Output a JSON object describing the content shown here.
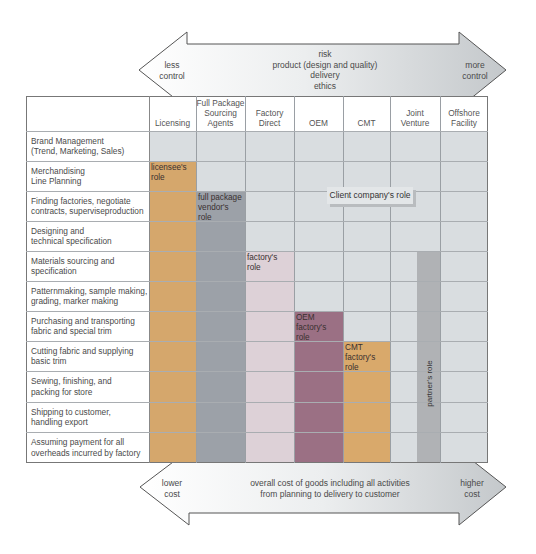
{
  "top_arrow": {
    "left_label": "less\ncontrol",
    "center_label": "risk\nproduct (design and quality)\ndelivery\nethics",
    "right_label": "more\ncontrol"
  },
  "bottom_arrow": {
    "left_label": "lower\ncost",
    "center_label": "overall cost of goods including all activities\nfrom planning to delivery to customer",
    "right_label": "higher\ncost"
  },
  "columns": [
    {
      "label": "Licensing"
    },
    {
      "label": "Full Package\nSourcing\nAgents"
    },
    {
      "label": "Factory\nDirect"
    },
    {
      "label": "OEM"
    },
    {
      "label": "CMT"
    },
    {
      "label": "Joint\nVenture"
    },
    {
      "label": "Offshore\nFacility"
    }
  ],
  "rows": [
    {
      "label": "Brand Management\n(Trend, Marketing, Sales)"
    },
    {
      "label": "Merchandising\nLine Planning"
    },
    {
      "label": "Finding factories, negotiate\ncontracts, superviseproduction"
    },
    {
      "label": "Designing and\ntechnical specification"
    },
    {
      "label": "Materials sourcing and\nspecification"
    },
    {
      "label": "Patternmaking, sample making,\ngrading, marker making"
    },
    {
      "label": "Purchasing and transporting\nfabric and special trim"
    },
    {
      "label": "Cutting fabric and supplying\nbasic trim"
    },
    {
      "label": "Sewing, finishing, and\npacking for store"
    },
    {
      "label": "Shipping to customer,\nhandling export"
    },
    {
      "label": "Assuming payment for all\noverheads incurred by factory"
    }
  ],
  "roles": {
    "licensee": {
      "label": "licensee's\nrole",
      "color": "#d5a76c",
      "column": "Licensing",
      "start_row": 1
    },
    "full_package": {
      "label": "full package\nvendor's\nrole",
      "color": "#9ca1a8",
      "column": "Full Package Sourcing Agents",
      "start_row": 2
    },
    "factory_direct": {
      "label": "factory's\nrole",
      "color": "#ddd1d7",
      "column": "Factory Direct",
      "start_row": 4
    },
    "oem": {
      "label": "OEM\nfactory's\nrole",
      "color": "#9b7084",
      "column": "OEM",
      "start_row": 6
    },
    "cmt": {
      "label": "CMT\nfactory's\nrole",
      "color": "#d9a96b",
      "column": "CMT",
      "start_row": 7
    },
    "partner": {
      "label": "partner's role",
      "color": "#b0b2b5",
      "column": "Joint Venture",
      "start_row": 4
    },
    "client": {
      "label": "Client company's role",
      "color": "#d9dde0"
    }
  }
}
